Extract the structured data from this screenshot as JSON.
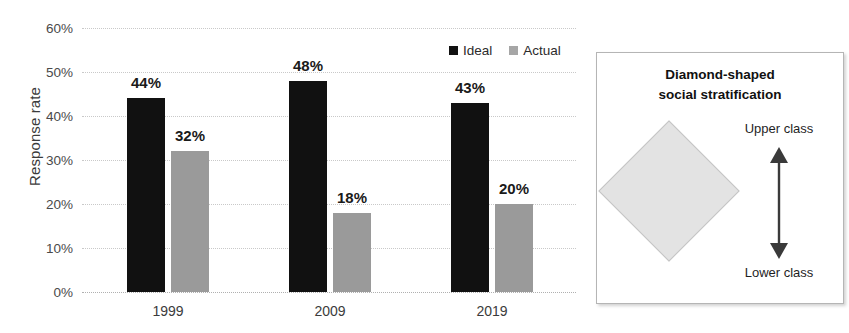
{
  "chart_data": {
    "type": "bar",
    "title": "",
    "xlabel": "",
    "ylabel": "Response rate",
    "categories": [
      "1999",
      "2009",
      "2019"
    ],
    "ylim": [
      0,
      60
    ],
    "ytick_labels": [
      "0%",
      "10%",
      "20%",
      "30%",
      "40%",
      "50%",
      "60%"
    ],
    "ytick_values": [
      0,
      10,
      20,
      30,
      40,
      50,
      60
    ],
    "grid": true,
    "legend_position": "top-right",
    "series": [
      {
        "name": "Ideal",
        "color": "#111111",
        "values": [
          44,
          48,
          43
        ],
        "value_labels": [
          "44%",
          "48%",
          "43%"
        ]
      },
      {
        "name": "Actual",
        "color": "#9a9a9a",
        "values": [
          32,
          18,
          20
        ],
        "value_labels": [
          "32%",
          "18%",
          "20%"
        ]
      }
    ]
  },
  "legend": {
    "items": [
      {
        "label": "Ideal",
        "color": "#111111"
      },
      {
        "label": "Actual",
        "color": "#a6a6a6"
      }
    ]
  },
  "diagram": {
    "title_line1": "Diamond-shaped",
    "title_line2": "social stratification",
    "upper_label": "Upper class",
    "lower_label": "Lower class",
    "shape": "diamond",
    "shape_fill": "#e3e3e3",
    "arrow_color": "#3a3a3a"
  }
}
